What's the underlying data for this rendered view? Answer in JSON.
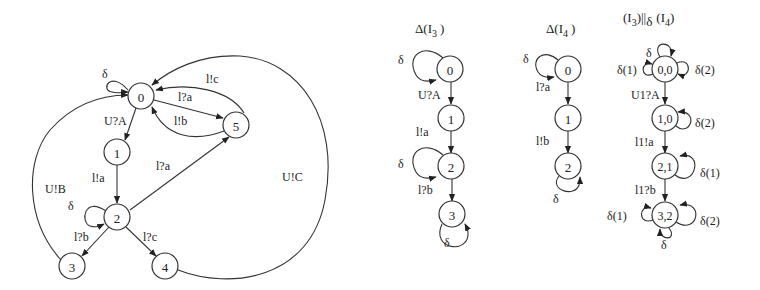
{
  "diagrams": {
    "left": {
      "title": "",
      "nodes": [
        {
          "id": "0",
          "label": "0"
        },
        {
          "id": "1",
          "label": "1"
        },
        {
          "id": "2",
          "label": "2"
        },
        {
          "id": "3",
          "label": "3"
        },
        {
          "id": "4",
          "label": "4"
        },
        {
          "id": "5",
          "label": "5"
        }
      ],
      "edges": [
        {
          "from": "0",
          "to": "0",
          "label": "δ"
        },
        {
          "from": "0",
          "to": "1",
          "label": "U?A"
        },
        {
          "from": "0",
          "to": "5",
          "label": "l?a"
        },
        {
          "from": "5",
          "to": "0",
          "label": "l!b"
        },
        {
          "from": "5",
          "to": "0",
          "label": "l!c"
        },
        {
          "from": "1",
          "to": "2",
          "label": "l!a"
        },
        {
          "from": "2",
          "to": "2",
          "label": "δ"
        },
        {
          "from": "2",
          "to": "5",
          "label": "l?a"
        },
        {
          "from": "2",
          "to": "3",
          "label": "l?b"
        },
        {
          "from": "2",
          "to": "4",
          "label": "l?c"
        },
        {
          "from": "3",
          "to": "0",
          "label": "U!B"
        },
        {
          "from": "4",
          "to": "0",
          "label": "U!C"
        }
      ]
    },
    "delta_i3": {
      "title_main": "Δ(I",
      "title_sub": "3",
      "title_end": ")",
      "nodes": [
        {
          "id": "0",
          "label": "0"
        },
        {
          "id": "1",
          "label": "1"
        },
        {
          "id": "2",
          "label": "2"
        },
        {
          "id": "3",
          "label": "3"
        }
      ],
      "edges": [
        {
          "from": "0",
          "to": "0",
          "label": "δ"
        },
        {
          "from": "0",
          "to": "1",
          "label": "U?A"
        },
        {
          "from": "1",
          "to": "2",
          "label": "l!a"
        },
        {
          "from": "2",
          "to": "2",
          "label": "δ"
        },
        {
          "from": "2",
          "to": "3",
          "label": "l?b"
        },
        {
          "from": "3",
          "to": "3",
          "label": "δ"
        }
      ]
    },
    "delta_i4": {
      "title_main": "Δ(I",
      "title_sub": "4",
      "title_end": ")",
      "nodes": [
        {
          "id": "0",
          "label": "0"
        },
        {
          "id": "1",
          "label": "1"
        },
        {
          "id": "2",
          "label": "2"
        }
      ],
      "edges": [
        {
          "from": "0",
          "to": "0",
          "label": "δ"
        },
        {
          "from": "0",
          "to": "1",
          "label": "l?a"
        },
        {
          "from": "1",
          "to": "2",
          "label": "l!b"
        },
        {
          "from": "2",
          "to": "2",
          "label": "δ"
        }
      ]
    },
    "composition": {
      "title_a": "(I",
      "title_a_sub": "3",
      "title_op": ")||",
      "title_op_sub": "δ",
      "title_b": "(I",
      "title_b_sub": "4",
      "title_end": ")",
      "nodes": [
        {
          "id": "0,0",
          "label": "0,0"
        },
        {
          "id": "1,0",
          "label": "1,0"
        },
        {
          "id": "2,1",
          "label": "2,1"
        },
        {
          "id": "3,2",
          "label": "3,2"
        }
      ],
      "edges": [
        {
          "from": "0,0",
          "to": "0,0",
          "label": "δ"
        },
        {
          "from": "0,0",
          "to": "0,0",
          "label": "δ(1)"
        },
        {
          "from": "0,0",
          "to": "0,0",
          "label": "δ(2)"
        },
        {
          "from": "0,0",
          "to": "1,0",
          "label": "U1?A"
        },
        {
          "from": "1,0",
          "to": "1,0",
          "label": "δ(2)"
        },
        {
          "from": "1,0",
          "to": "2,1",
          "label": "l1!a"
        },
        {
          "from": "2,1",
          "to": "2,1",
          "label": "δ(1)"
        },
        {
          "from": "2,1",
          "to": "3,2",
          "label": "l1?b"
        },
        {
          "from": "3,2",
          "to": "3,2",
          "label": "δ(1)"
        },
        {
          "from": "3,2",
          "to": "3,2",
          "label": "δ(2)"
        },
        {
          "from": "3,2",
          "to": "3,2",
          "label": "δ"
        }
      ]
    }
  }
}
